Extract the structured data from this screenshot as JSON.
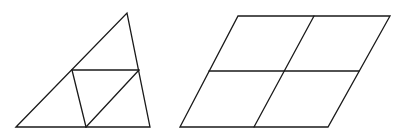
{
  "figures": [
    {
      "id": "triangle",
      "description": "Triangle subdivided by joining edge midpoints into four smaller triangles",
      "subdivisions": 4
    },
    {
      "id": "parallelogram",
      "description": "Parallelogram subdivided by joining midpoints of opposite sides into four smaller parallelograms",
      "subdivisions": 4
    }
  ],
  "colors": {
    "stroke": "#1a1a1a",
    "background": "#ffffff"
  }
}
